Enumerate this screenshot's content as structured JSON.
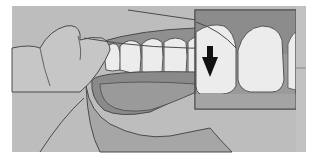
{
  "illustration": {
    "subject": "flossing teeth",
    "inset": "close-up of floss between teeth",
    "arrow_direction": "down",
    "colors": {
      "background": "#ffffff",
      "frame_bg": "#b8b8b8",
      "skin": "#c4c4c4",
      "skin_dark": "#a8a8a8",
      "gum": "#8e8e8e",
      "mouth_inner": "#8a8a8a",
      "lip": "#a2a2a2",
      "tooth": "#ececec",
      "outline": "#4a4a4a",
      "arrow": "#111111"
    }
  }
}
